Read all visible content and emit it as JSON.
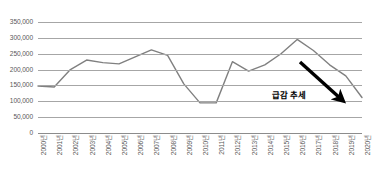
{
  "chart_data": {
    "type": "line",
    "title": "",
    "xlabel": "",
    "ylabel": "",
    "ylim": [
      0,
      350000
    ],
    "ytick_step": 50000,
    "grid": true,
    "legend": null,
    "legend_position": "none",
    "line_color": "#808080",
    "categories": [
      "2000년",
      "2001년",
      "2002년",
      "2003년",
      "2004년",
      "2005년",
      "2006년",
      "2007년",
      "2008년",
      "2009년",
      "2010년",
      "2011년",
      "2012년",
      "2013년",
      "2014년",
      "2015년",
      "2016년",
      "2017년",
      "2018년",
      "2019년",
      "2020년"
    ],
    "values": [
      148000,
      145000,
      200000,
      230000,
      222000,
      218000,
      240000,
      262000,
      245000,
      155000,
      95000,
      95000,
      225000,
      195000,
      215000,
      250000,
      295000,
      260000,
      215000,
      180000,
      112000
    ],
    "ytick_labels": [
      "350,000",
      "300,000",
      "250,000",
      "200,000",
      "150,000",
      "100,000",
      "50,000",
      "0"
    ],
    "ytick_values": [
      350000,
      300000,
      250000,
      200000,
      150000,
      100000,
      50000,
      0
    ],
    "annotations": [
      {
        "text": "급감 추세",
        "kind": "arrow-annotation",
        "arrow_color": "#000000",
        "arrow_from": [
          300,
          62
        ],
        "arrow_to": [
          341,
          99
        ]
      }
    ]
  }
}
